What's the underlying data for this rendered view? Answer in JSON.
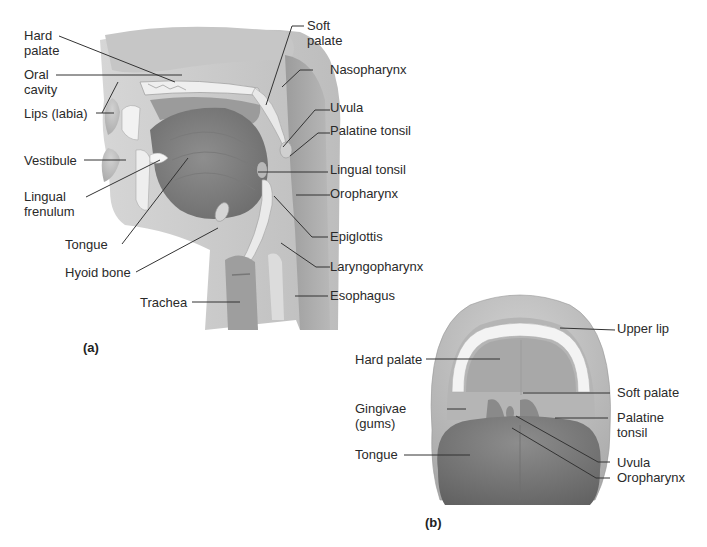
{
  "figure": {
    "panel_a": {
      "tag": "(a)",
      "view": "sagittal section of head and neck",
      "labels": {
        "hard_palate": "Hard\npalate",
        "oral_cavity": "Oral\ncavity",
        "lips": "Lips (labia)",
        "vestibule": "Vestibule",
        "lingual_frenulum": "Lingual\nfrenulum",
        "tongue": "Tongue",
        "hyoid_bone": "Hyoid bone",
        "trachea": "Trachea",
        "soft_palate": "Soft\npalate",
        "nasopharynx": "Nasopharynx",
        "uvula": "Uvula",
        "palatine_tonsil": "Palatine tonsil",
        "lingual_tonsil": "Lingual tonsil",
        "oropharynx": "Oropharynx",
        "epiglottis": "Epiglottis",
        "laryngopharynx": "Laryngopharynx",
        "esophagus": "Esophagus"
      }
    },
    "panel_b": {
      "tag": "(b)",
      "view": "anterior view of open mouth",
      "labels": {
        "upper_lip": "Upper lip",
        "hard_palate": "Hard palate",
        "soft_palate": "Soft palate",
        "gingivae": "Gingivae\n(gums)",
        "palatine_tonsil": "Palatine\ntonsil",
        "tongue": "Tongue",
        "uvula": "Uvula",
        "oropharynx": "Oropharynx"
      }
    },
    "colors": {
      "tissue_light": "#d9d9d9",
      "tissue_mid": "#a9a9a9",
      "tissue_dark": "#8a8a8a",
      "bone": "#eeeeee",
      "leader_line": "#333333"
    }
  }
}
